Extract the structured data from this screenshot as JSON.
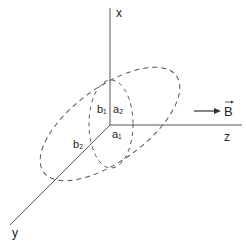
{
  "diagram": {
    "title": "",
    "axes": {
      "x": {
        "label": "x"
      },
      "y": {
        "label": "y"
      },
      "z": {
        "label": "z"
      }
    },
    "field": {
      "label": "B",
      "arrow": "→"
    },
    "labels": {
      "a1": "a₁",
      "a2": "a₂",
      "b1": "b₁",
      "b2": "b₂"
    },
    "colors": {
      "line": "#555555",
      "text": "#222222",
      "background": "#ffffff"
    }
  }
}
